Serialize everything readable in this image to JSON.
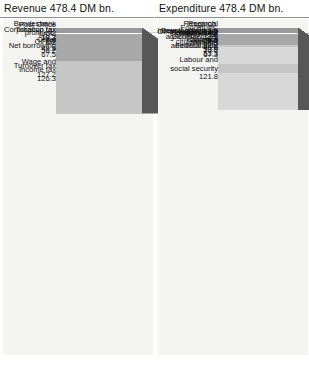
{
  "chart_data": {
    "type": "bar",
    "subtype": "3d-stacked-column-comparison",
    "unit": "DM bn.",
    "total": 478.4,
    "xlabel": "",
    "ylabel": "",
    "grid": false,
    "legend": "none",
    "categories": [
      "Revenue",
      "Expenditure"
    ],
    "series": [
      {
        "name": "Revenue 478.4 DM bn.",
        "header": "Revenue 478.4 DM bn.",
        "total": 478.4,
        "items": [
          {
            "label": "Wage and\nincome tax",
            "value": 126.3,
            "display": "126.3",
            "inline": false
          },
          {
            "label": "Turnover tax",
            "value": 127.2,
            "display": "127.2",
            "inline": false
          },
          {
            "label": "Oil tax",
            "value": 56.2,
            "display": "56.2",
            "inline": false
          },
          {
            "label": "Corporation tax",
            "value": 19.2,
            "display": "19.2",
            "inline": false
          },
          {
            "label": "Tobacco tax",
            "value": 19.3,
            "display": "19.3",
            "inline": false
          },
          {
            "label": "Post Office profit",
            "value": 6.2,
            "display": "6.2",
            "inline": false
          },
          {
            "label": "Bundesbank\nprofit etc.",
            "value": 7.0,
            "display": "7.0",
            "inline": false
          },
          {
            "label": "Net borrowing",
            "value": 67.5,
            "display": "67.5",
            "inline": false
          },
          {
            "label": "Other",
            "value": 49.5,
            "display": "49.5",
            "inline": false
          }
        ]
      },
      {
        "name": "Expenditure 478.4 DM bn.",
        "header": "Expenditure 478.4 DM bn.",
        "total": 478.4,
        "items": [
          {
            "label": "Labour and\nsocial security",
            "value": 121.8,
            "display": "121.8",
            "inline": false
          },
          {
            "label": "Federal debt",
            "value": 67.3,
            "display": "67.3",
            "inline": false
          },
          {
            "label": "Defence",
            "value": 48.6,
            "display": "48.6",
            "inline": false
          },
          {
            "label": "General fiscal\nadministration",
            "value": 53.3,
            "display": "53.3",
            "inline": false
          },
          {
            "label": "Transport",
            "value": 53.9,
            "display": "53.9",
            "inline": false
          },
          {
            "label": "Family, senior\ncitizens",
            "value": 28.4,
            "display": "28.4",
            "inline": true
          },
          {
            "label": "Industry",
            "value": 14.7,
            "display": "14.7",
            "inline": true
          },
          {
            "label": "Foodstuffs,\nagriculture",
            "value": 13.5,
            "display": "13.5",
            "inline": true
          },
          {
            "label": "Pensions",
            "value": 14.3,
            "display": "14.3",
            "inline": true
          },
          {
            "label": "Research,\ntechnology",
            "value": 9.5,
            "display": "9.5",
            "inline": false
          },
          {
            "label": "Internal affairs",
            "value": 8.5,
            "display": "8.5",
            "inline": true
          },
          {
            "label": "Development aid",
            "value": 8.4,
            "display": "8.4",
            "inline": true
          },
          {
            "label": "Regional planning,\nbuilding",
            "value": 10.6,
            "display": "10.6",
            "inline": false
          },
          {
            "label": "Other expenditure",
            "value": 25.6,
            "display": "25.6",
            "inline": false
          }
        ]
      }
    ]
  },
  "colors": {
    "background": "#ffffff",
    "panel": "#f4f4f2",
    "face_light": "#d8d8d8",
    "face_mid": "#c6c6c6",
    "face_dark": "#a8a8a8",
    "top_face": "#9a9a9a",
    "side_face": "#575757",
    "rule": "#8d8d8d",
    "text": "#111111"
  }
}
